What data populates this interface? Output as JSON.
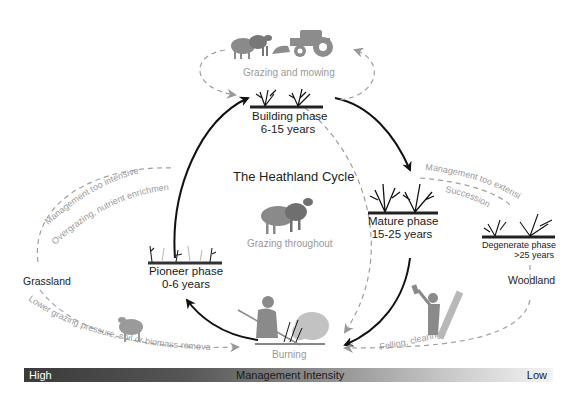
{
  "title": "The Heathland Cycle",
  "phases": {
    "building": {
      "name": "Building phase",
      "years": "6-15 years"
    },
    "mature": {
      "name": "Mature phase",
      "years": "15-25 years"
    },
    "degenerate": {
      "name": "Degenerate phase",
      "years": ">25 years"
    },
    "pioneer": {
      "name": "Pioneer phase",
      "years": "0-6 years"
    }
  },
  "states": {
    "grassland": "Grassland",
    "woodland": "Woodland",
    "burning": "Burning"
  },
  "processes": {
    "grazing_mowing": "Grazing and mowing",
    "grazing_throughout": "Grazing throughout",
    "management_too_intensive": "Management too intensive",
    "overgrazing": "Overgrazing, nutrient enrichment",
    "management_too_extensive": "Management too extensive",
    "succession": "Succession",
    "lower_grazing": "Lower grazing pressure, soil or biomass removal",
    "felling": "Felling, clearing"
  },
  "intensity_bar": {
    "label": "Management Intensity",
    "high": "High",
    "low": "Low",
    "colors": {
      "high": "#3a3a3a",
      "low": "#f4f4f4"
    }
  },
  "icons": [
    "sheep-icon",
    "tractor-icon",
    "heather-shrub-icon",
    "person-burning-icon",
    "fire-smoke-icon",
    "lumberjack-axe-icon"
  ]
}
